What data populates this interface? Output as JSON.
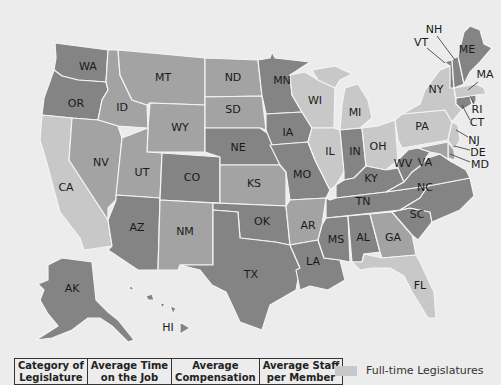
{
  "map": {
    "title": "Full-time vs Part-time State Legislatures",
    "colors": {
      "background": "#ececec",
      "full_time": "#c8c8c8",
      "hybrid": "#a3a3a3",
      "part_time": "#848484",
      "border": "#f4f4f4"
    },
    "states": [
      {
        "code": "WA",
        "label": "WA",
        "category": "part_time"
      },
      {
        "code": "OR",
        "label": "OR",
        "category": "part_time"
      },
      {
        "code": "CA",
        "label": "CA",
        "category": "full_time"
      },
      {
        "code": "ID",
        "label": "ID",
        "category": "hybrid"
      },
      {
        "code": "NV",
        "label": "NV",
        "category": "hybrid"
      },
      {
        "code": "MT",
        "label": "MT",
        "category": "hybrid"
      },
      {
        "code": "WY",
        "label": "WY",
        "category": "hybrid"
      },
      {
        "code": "UT",
        "label": "UT",
        "category": "hybrid"
      },
      {
        "code": "AZ",
        "label": "AZ",
        "category": "part_time"
      },
      {
        "code": "CO",
        "label": "CO",
        "category": "part_time"
      },
      {
        "code": "NM",
        "label": "NM",
        "category": "hybrid"
      },
      {
        "code": "ND",
        "label": "ND",
        "category": "hybrid"
      },
      {
        "code": "SD",
        "label": "SD",
        "category": "hybrid"
      },
      {
        "code": "NE",
        "label": "NE",
        "category": "part_time"
      },
      {
        "code": "KS",
        "label": "KS",
        "category": "hybrid"
      },
      {
        "code": "OK",
        "label": "OK",
        "category": "part_time"
      },
      {
        "code": "TX",
        "label": "TX",
        "category": "part_time"
      },
      {
        "code": "MN",
        "label": "MN",
        "category": "part_time"
      },
      {
        "code": "IA",
        "label": "IA",
        "category": "part_time"
      },
      {
        "code": "MO",
        "label": "MO",
        "category": "part_time"
      },
      {
        "code": "AR",
        "label": "AR",
        "category": "hybrid"
      },
      {
        "code": "LA",
        "label": "LA",
        "category": "part_time"
      },
      {
        "code": "WI",
        "label": "WI",
        "category": "full_time"
      },
      {
        "code": "IL",
        "label": "IL",
        "category": "full_time"
      },
      {
        "code": "MI",
        "label": "MI",
        "category": "full_time"
      },
      {
        "code": "IN",
        "label": "IN",
        "category": "part_time"
      },
      {
        "code": "OH",
        "label": "OH",
        "category": "full_time"
      },
      {
        "code": "KY",
        "label": "KY",
        "category": "part_time"
      },
      {
        "code": "TN",
        "label": "TN",
        "category": "part_time"
      },
      {
        "code": "MS",
        "label": "MS",
        "category": "part_time"
      },
      {
        "code": "AL",
        "label": "AL",
        "category": "part_time"
      },
      {
        "code": "GA",
        "label": "GA",
        "category": "hybrid"
      },
      {
        "code": "FL",
        "label": "FL",
        "category": "full_time"
      },
      {
        "code": "SC",
        "label": "SC",
        "category": "part_time"
      },
      {
        "code": "NC",
        "label": "NC",
        "category": "part_time"
      },
      {
        "code": "VA",
        "label": "VA",
        "category": "part_time"
      },
      {
        "code": "WV",
        "label": "WV",
        "category": "part_time"
      },
      {
        "code": "PA",
        "label": "PA",
        "category": "full_time"
      },
      {
        "code": "NY",
        "label": "NY",
        "category": "full_time"
      },
      {
        "code": "VT",
        "label": "VT",
        "category": "part_time"
      },
      {
        "code": "NH",
        "label": "NH",
        "category": "part_time"
      },
      {
        "code": "ME",
        "label": "ME",
        "category": "part_time"
      },
      {
        "code": "MA",
        "label": "MA",
        "category": "full_time"
      },
      {
        "code": "RI",
        "label": "RI",
        "category": "part_time"
      },
      {
        "code": "CT",
        "label": "CT",
        "category": "part_time"
      },
      {
        "code": "NJ",
        "label": "NJ",
        "category": "full_time"
      },
      {
        "code": "DE",
        "label": "DE",
        "category": "hybrid"
      },
      {
        "code": "MD",
        "label": "MD",
        "category": "hybrid"
      },
      {
        "code": "AK",
        "label": "AK",
        "category": "part_time"
      },
      {
        "code": "HI",
        "label": "HI",
        "category": "part_time"
      }
    ]
  },
  "table": {
    "headers": [
      {
        "line1": "Category of",
        "line2": "Legislature"
      },
      {
        "line1": "Average Time",
        "line2": "on the Job"
      },
      {
        "line1": "Average",
        "line2": "Compensation"
      },
      {
        "line1": "Average Staff",
        "line2": "per Member"
      }
    ]
  },
  "legend": {
    "items": [
      {
        "label": "Full-time Legislatures",
        "color": "#c8c8c8"
      }
    ]
  }
}
